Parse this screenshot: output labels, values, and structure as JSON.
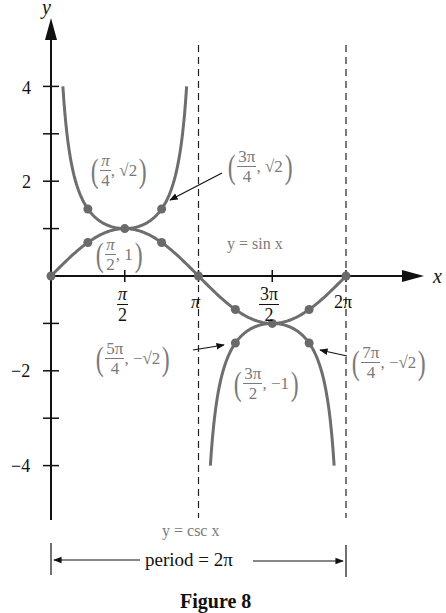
{
  "chart_data": {
    "type": "line",
    "title": "",
    "xlabel": "x",
    "ylabel": "y",
    "xlim": [
      0,
      6.5
    ],
    "ylim": [
      -4.5,
      5
    ],
    "grid": false,
    "x_ticks": [
      {
        "value": 1.5708,
        "label_num": "π",
        "label_den": "2"
      },
      {
        "value": 3.1416,
        "label": "π"
      },
      {
        "value": 4.7124,
        "label_num": "3π",
        "label_den": "2"
      },
      {
        "value": 6.2832,
        "label": "2π"
      }
    ],
    "y_ticks": [
      {
        "value": 4,
        "label": "4"
      },
      {
        "value": 3,
        "label": ""
      },
      {
        "value": 2,
        "label": "2"
      },
      {
        "value": 1,
        "label": ""
      },
      {
        "value": -1,
        "label": ""
      },
      {
        "value": -2,
        "label": "−2"
      },
      {
        "value": -3,
        "label": ""
      },
      {
        "value": -4,
        "label": "−4"
      }
    ],
    "asymptotes": [
      3.1416,
      6.2832
    ],
    "series": [
      {
        "name": "y = sin x",
        "function": "sin",
        "x_range": [
          0,
          6.2832
        ],
        "color": "#6e6e6e"
      },
      {
        "name": "y = csc x",
        "function": "csc",
        "branches": [
          [
            0.2527,
            2.8889
          ],
          [
            3.3943,
            6.0305
          ]
        ],
        "color": "#6e6e6e"
      }
    ],
    "marked_points": {
      "sin": [
        {
          "x": 0,
          "y": 0
        },
        {
          "x": 0.7854,
          "y": 0.7071
        },
        {
          "x": 1.5708,
          "y": 1
        },
        {
          "x": 2.3562,
          "y": 0.7071
        },
        {
          "x": 3.1416,
          "y": 0
        },
        {
          "x": 3.927,
          "y": -0.7071
        },
        {
          "x": 4.7124,
          "y": -1
        },
        {
          "x": 5.4978,
          "y": -0.7071
        },
        {
          "x": 6.2832,
          "y": 0
        }
      ],
      "csc": [
        {
          "x": 0.7854,
          "y": 1.4142
        },
        {
          "x": 2.3562,
          "y": 1.4142
        },
        {
          "x": 3.927,
          "y": -1.4142
        },
        {
          "x": 5.4978,
          "y": -1.4142
        }
      ]
    },
    "annotations": [
      {
        "id": "p1",
        "num": "π",
        "den": "4",
        "rest": ", √2",
        "point": [
          0.7854,
          1.4142
        ]
      },
      {
        "id": "p2",
        "num": "3π",
        "den": "4",
        "rest": ", √2",
        "point": [
          2.3562,
          1.4142
        ],
        "arrow": true
      },
      {
        "id": "p3",
        "num": "π",
        "den": "2",
        "rest": ", 1",
        "point": [
          1.5708,
          1
        ]
      },
      {
        "id": "p4",
        "num": "5π",
        "den": "4",
        "rest": ", −√2",
        "point": [
          3.927,
          -1.4142
        ],
        "arrow": true
      },
      {
        "id": "p5",
        "num": "3π",
        "den": "2",
        "rest": ", −1",
        "point": [
          4.7124,
          -1
        ]
      },
      {
        "id": "p6",
        "num": "7π",
        "den": "4",
        "rest": ", −√2",
        "point": [
          5.4978,
          -1.4142
        ],
        "arrow": true
      }
    ],
    "labels": {
      "sin_curve": "y = sin x",
      "csc_curve": "y = csc x",
      "period": "period = 2π"
    },
    "caption": "Figure 8"
  }
}
